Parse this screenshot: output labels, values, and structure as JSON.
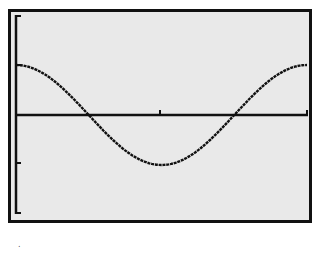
{
  "screen": {
    "type": "graphing-calculator-display",
    "background_color": "#e9e9e9",
    "frame_color": "#111111",
    "plot_color": "#111111"
  },
  "graph": {
    "function": "y = cos(x)",
    "window": {
      "xmin": 0,
      "xmax": 6.2832,
      "xscl": 3.1416,
      "ymin": -2,
      "ymax": 2,
      "yscl": 1
    },
    "y_ticks": [
      2,
      1,
      -1,
      -2
    ],
    "x_ticks": [
      3.1416,
      6.2832
    ],
    "features": {
      "start_value": 1,
      "first_zero": 1.5708,
      "minimum": -1,
      "minimum_x": 3.1416,
      "second_zero": 4.7124,
      "end_value": 1
    }
  },
  "chart_data": {
    "type": "line",
    "title": "",
    "xlabel": "",
    "ylabel": "",
    "xlim": [
      0,
      6.2832
    ],
    "ylim": [
      -2,
      2
    ],
    "grid": false,
    "legend": "none",
    "series": [
      {
        "name": "cos(x)",
        "x": [
          0,
          0.7854,
          1.5708,
          2.3562,
          3.1416,
          3.927,
          4.7124,
          5.4978,
          6.2832
        ],
        "values": [
          1,
          0.707,
          0,
          -0.707,
          -1,
          -0.707,
          0,
          0.707,
          1
        ]
      }
    ]
  },
  "caption": {
    "text": "."
  }
}
